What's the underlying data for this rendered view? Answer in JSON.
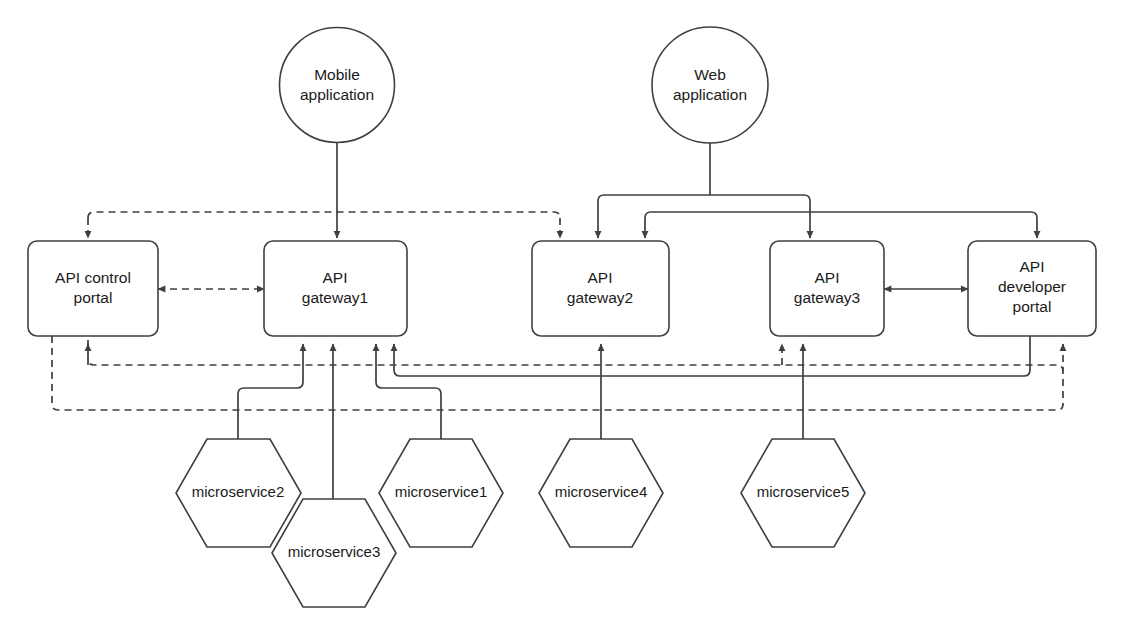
{
  "diagram": {
    "background_color": "#ffffff",
    "stroke_color": "#3f3f3f",
    "text_color": "#1b1b1b",
    "nodes": {
      "mobile_app": {
        "label_line1": "Mobile",
        "label_line2": "application",
        "shape": "circle"
      },
      "web_app": {
        "label_line1": "Web",
        "label_line2": "application",
        "shape": "circle"
      },
      "api_control_portal": {
        "label_line1": "API control",
        "label_line2": "portal",
        "shape": "rounded-rect"
      },
      "api_gateway1": {
        "label_line1": "API",
        "label_line2": "gateway1",
        "shape": "rounded-rect"
      },
      "api_gateway2": {
        "label_line1": "API",
        "label_line2": "gateway2",
        "shape": "rounded-rect"
      },
      "api_gateway3": {
        "label_line1": "API",
        "label_line2": "gateway3",
        "shape": "rounded-rect"
      },
      "api_developer_portal": {
        "label_line1": "API",
        "label_line2": "developer",
        "label_line3": "portal",
        "shape": "rounded-rect"
      },
      "microservice1": {
        "label": "microservice1",
        "shape": "hexagon"
      },
      "microservice2": {
        "label": "microservice2",
        "shape": "hexagon"
      },
      "microservice3": {
        "label": "microservice3",
        "shape": "hexagon"
      },
      "microservice4": {
        "label": "microservice4",
        "shape": "hexagon"
      },
      "microservice5": {
        "label": "microservice5",
        "shape": "hexagon"
      }
    },
    "edges": [
      {
        "from": "mobile_app",
        "to": "api_gateway1",
        "style": "solid",
        "arrows": "one-way"
      },
      {
        "from": "web_app",
        "to": "api_gateway2",
        "style": "solid",
        "arrows": "one-way"
      },
      {
        "from": "web_app",
        "to": "api_gateway3",
        "style": "solid",
        "arrows": "one-way"
      },
      {
        "from": "web_app",
        "to": "api_gateway2",
        "style": "solid",
        "arrows": "one-way"
      },
      {
        "from": "web_app",
        "to": "api_developer_portal",
        "style": "solid",
        "arrows": "one-way"
      },
      {
        "from": "api_control_portal",
        "to": "api_gateway1",
        "style": "dashed",
        "arrows": "two-way"
      },
      {
        "from": "api_gateway3",
        "to": "api_developer_portal",
        "style": "solid",
        "arrows": "two-way"
      },
      {
        "from": "microservice1",
        "to": "api_gateway1",
        "style": "solid",
        "arrows": "one-way"
      },
      {
        "from": "microservice2",
        "to": "api_gateway1",
        "style": "solid",
        "arrows": "one-way"
      },
      {
        "from": "microservice3",
        "to": "api_gateway1",
        "style": "solid",
        "arrows": "one-way"
      },
      {
        "from": "microservice4",
        "to": "api_gateway2",
        "style": "solid",
        "arrows": "one-way"
      },
      {
        "from": "microservice5",
        "to": "api_gateway3",
        "style": "solid",
        "arrows": "one-way"
      },
      {
        "from": "microservice5",
        "to": "api_gateway1",
        "style": "solid",
        "arrows": "one-way"
      },
      {
        "from": "api_developer_portal",
        "to": "api_gateway1",
        "style": "solid",
        "arrows": "one-way"
      },
      {
        "from": "api_control_portal",
        "to": "api_gateway2",
        "style": "dashed",
        "arrows": "one-way"
      },
      {
        "from": "api_control_portal",
        "to": "api_gateway3",
        "style": "dashed",
        "arrows": "one-way"
      },
      {
        "from": "api_control_portal",
        "to": "api_developer_portal",
        "style": "dashed",
        "arrows": "one-way"
      }
    ]
  }
}
